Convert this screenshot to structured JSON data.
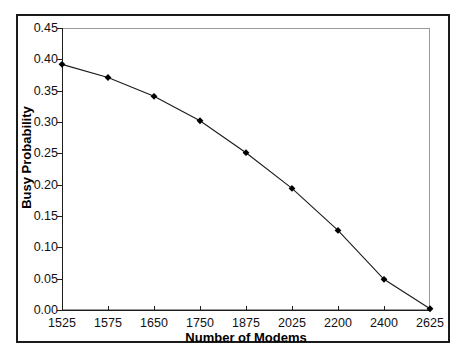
{
  "chart_data": {
    "type": "line",
    "title": "",
    "xlabel": "Number of Modems",
    "ylabel": "Busy Probability",
    "categories": [
      "1525",
      "1575",
      "1650",
      "1750",
      "1875",
      "2025",
      "2200",
      "2400",
      "2625"
    ],
    "values": [
      0.392,
      0.371,
      0.341,
      0.302,
      0.251,
      0.194,
      0.127,
      0.049,
      0.002
    ],
    "series": [
      {
        "name": "Busy Probability",
        "values": [
          0.392,
          0.371,
          0.341,
          0.302,
          0.251,
          0.194,
          0.127,
          0.049,
          0.002
        ]
      }
    ],
    "ylim": [
      0.0,
      0.45
    ],
    "ytick_labels": [
      "0.00",
      "0.05",
      "0.10",
      "0.15",
      "0.20",
      "0.25",
      "0.30",
      "0.35",
      "0.40",
      "0.45"
    ],
    "ytick_values": [
      0.0,
      0.05,
      0.1,
      0.15,
      0.2,
      0.25,
      0.3,
      0.35,
      0.4,
      0.45
    ],
    "grid": false,
    "legend": false,
    "legend_position": "none",
    "marker": "diamond",
    "line_color": "#1a1a1a",
    "marker_color": "#000000",
    "plot_border_color": "#9a9a9a",
    "frame_color": "#1a1a1a",
    "background_color": "#ffffff"
  }
}
